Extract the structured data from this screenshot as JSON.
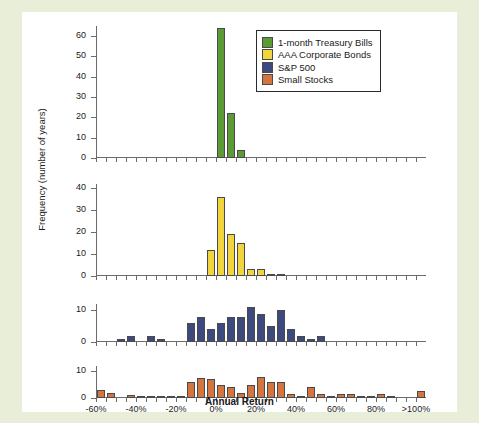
{
  "chart_data": {
    "type": "bar",
    "title": "",
    "subtitle": "",
    "xlabel": "Annual Return",
    "ylabel": "Frequency (number of years)",
    "grid": false,
    "legend_position": "top-right",
    "bin_width": 5,
    "x_bin_starts": [
      -60,
      -55,
      -50,
      -45,
      -40,
      -35,
      -30,
      -25,
      -20,
      -15,
      -10,
      -5,
      0,
      5,
      10,
      15,
      20,
      25,
      30,
      35,
      40,
      45,
      50,
      55,
      60,
      65,
      70,
      75,
      80,
      85,
      90,
      95,
      100
    ],
    "xticks": [
      -60,
      -40,
      -20,
      0,
      20,
      40,
      60,
      80,
      100
    ],
    "xtick_labels": [
      "-60%",
      "-40%",
      "-20%",
      "0%",
      "20%",
      "40%",
      "60%",
      "80%",
      ">100%"
    ],
    "xlim": [
      -60,
      105
    ],
    "panels": [
      {
        "name": "1-month Treasury Bills",
        "color": "#5b9b33",
        "ylim": [
          0,
          65
        ],
        "yticks": [
          0,
          10,
          20,
          30,
          40,
          50,
          60
        ],
        "values": [
          0,
          0,
          0,
          0,
          0,
          0,
          0,
          0,
          0,
          0,
          0,
          0,
          64,
          22,
          4,
          0,
          0,
          0,
          0,
          0,
          0,
          0,
          0,
          0,
          0,
          0,
          0,
          0,
          0,
          0,
          0,
          0,
          0
        ]
      },
      {
        "name": "AAA Corporate Bonds",
        "color": "#f2d53c",
        "ylim": [
          0,
          42
        ],
        "yticks": [
          0,
          10,
          20,
          30,
          40
        ],
        "values": [
          0,
          0,
          0,
          0,
          0,
          0,
          0,
          0,
          0,
          0,
          0,
          12,
          36,
          19,
          15,
          3,
          3,
          1,
          1,
          0,
          0,
          0,
          0,
          0,
          0,
          0,
          0,
          0,
          0,
          0,
          0,
          0,
          0
        ]
      },
      {
        "name": "S&P 500",
        "color": "#3c4a80",
        "ylim": [
          0,
          12
        ],
        "yticks": [
          0,
          10
        ],
        "values": [
          0,
          0,
          1,
          2,
          0,
          2,
          1,
          0,
          0,
          6,
          8,
          4,
          6,
          8,
          8,
          11,
          9,
          5,
          10,
          4,
          2,
          1,
          2,
          0,
          0,
          0,
          0,
          0,
          0,
          0,
          0,
          0,
          0
        ]
      },
      {
        "name": "Small Stocks",
        "color": "#d4743f",
        "ylim": [
          0,
          12
        ],
        "yticks": [
          0,
          10
        ],
        "values": [
          3,
          2,
          0,
          1,
          0.6,
          0.6,
          0.6,
          0.6,
          0.6,
          6,
          7.5,
          7,
          5,
          4,
          2,
          5,
          8,
          6,
          6,
          1.5,
          0.6,
          4,
          1.5,
          0.6,
          1.5,
          1.5,
          0.6,
          0.6,
          1.5,
          0.6,
          0,
          0,
          2.5
        ]
      }
    ],
    "legend": [
      {
        "label": "1-month Treasury Bills",
        "color": "#5b9b33"
      },
      {
        "label": "AAA Corporate Bonds",
        "color": "#f2d53c"
      },
      {
        "label": "S&P 500",
        "color": "#3c4a80"
      },
      {
        "label": "Small Stocks",
        "color": "#d4743f"
      }
    ]
  },
  "figure": {
    "background": "#ffffff",
    "page_background": "#e8eed8",
    "axis_color": "#6b6b6b",
    "text_color": "#1a1a1a"
  }
}
